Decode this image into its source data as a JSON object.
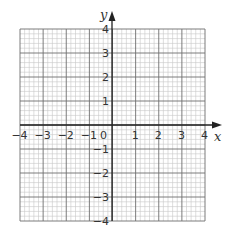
{
  "figure": {
    "type": "coordinate-grid",
    "x_axis": {
      "label": "x",
      "min": -4,
      "max": 4,
      "ticks": [
        -4,
        -3,
        -2,
        -1,
        1,
        2,
        3,
        4
      ]
    },
    "y_axis": {
      "label": "y",
      "min": -4,
      "max": 4,
      "ticks": [
        -4,
        -3,
        -2,
        -1,
        1,
        2,
        3,
        4
      ]
    },
    "origin_label": "0",
    "minor_divisions_per_unit": 5,
    "tick_labels": {
      "x": [
        "−4",
        "−3",
        "−2",
        "−1",
        "1",
        "2",
        "3",
        "4"
      ],
      "y": [
        "4",
        "3",
        "2",
        "1",
        "−1",
        "−2",
        "−3",
        "−4"
      ]
    },
    "colors": {
      "minor_grid": "#c8c8c8",
      "major_grid": "#6e6e6e",
      "axis": "#222222",
      "text": "#333333"
    }
  }
}
